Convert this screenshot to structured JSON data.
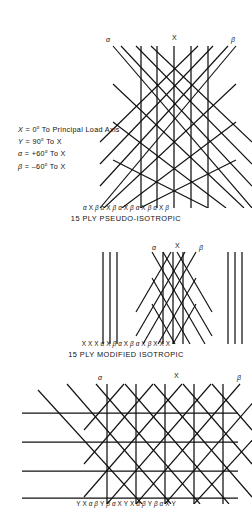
{
  "legend": {
    "lines": [
      {
        "sym": "X",
        "rest": " = 0° To Principal Load Axis"
      },
      {
        "sym": "Y",
        "rest": " = 90° To X"
      },
      {
        "sym": "α",
        "rest": " = +60° To X"
      },
      {
        "sym": "β",
        "rest": " = –60° To X"
      }
    ]
  },
  "figures": [
    {
      "id": "pseudo-isotropic",
      "caption": "15 PLY PSEUDO-ISOTROPIC",
      "labels": {
        "left": "α",
        "center": "X",
        "right": "β"
      },
      "ply_sequence": [
        "α",
        "X",
        "β",
        "α",
        "X",
        "β",
        "α",
        "X",
        "β",
        "α",
        "X",
        "β",
        "α",
        "X",
        "β"
      ]
    },
    {
      "id": "modified-isotropic",
      "caption": "15 PLY MODIFIED ISOTROPIC",
      "labels": {
        "left": "α",
        "center": "X",
        "right": "β"
      },
      "ply_sequence": [
        "X",
        "X",
        "X",
        "α",
        "X",
        "β",
        "α",
        "X",
        "β",
        "α",
        "X",
        "β",
        "X",
        "X",
        "X"
      ]
    },
    {
      "id": "woven-isotropic",
      "caption": "",
      "labels": {
        "left": "α",
        "center": "X",
        "right": "β"
      },
      "ply_sequence": [
        "Y",
        "X",
        "α",
        "β",
        "Y",
        "β",
        "α",
        "X",
        "Y",
        "X",
        "α",
        "β",
        "Y",
        "β",
        "α",
        "X",
        "Y"
      ]
    }
  ],
  "colors": {
    "ink": "#111111",
    "paper": "#ffffff"
  }
}
